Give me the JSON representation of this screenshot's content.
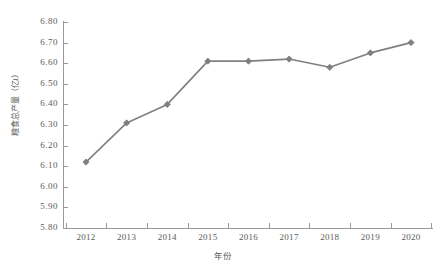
{
  "chart_data": {
    "type": "line",
    "title": "",
    "xlabel": "年份",
    "ylabel": "粮食总产量（亿t）",
    "categories": [
      "2012",
      "2013",
      "2014",
      "2015",
      "2016",
      "2017",
      "2018",
      "2019",
      "2020"
    ],
    "x": [
      2012,
      2013,
      2014,
      2015,
      2016,
      2017,
      2018,
      2019,
      2020
    ],
    "values": [
      6.12,
      6.31,
      6.4,
      6.61,
      6.61,
      6.62,
      6.58,
      6.65,
      6.7
    ],
    "series": [
      {
        "name": "粮食总产量",
        "values": [
          6.12,
          6.31,
          6.4,
          6.61,
          6.61,
          6.62,
          6.58,
          6.65,
          6.7
        ]
      }
    ],
    "ylim": [
      5.8,
      6.8
    ],
    "ytick_step": 0.1,
    "ytick_labels": [
      "6.80",
      "6.70",
      "6.60",
      "6.50",
      "6.40",
      "6.30",
      "6.20",
      "6.10",
      "6.00",
      "5.90",
      "5.80"
    ],
    "ytick_values": [
      6.8,
      6.7,
      6.6,
      6.5,
      6.4,
      6.3,
      6.2,
      6.1,
      6.0,
      5.9,
      5.8
    ],
    "grid": false,
    "legend": null,
    "legend_position": "none",
    "marker": "diamond",
    "colors": {
      "line": "#808080",
      "marker": "#7f7f7f",
      "axis": "#9a9a9a",
      "text": "#5a5a5a",
      "background": "#ffffff"
    }
  }
}
